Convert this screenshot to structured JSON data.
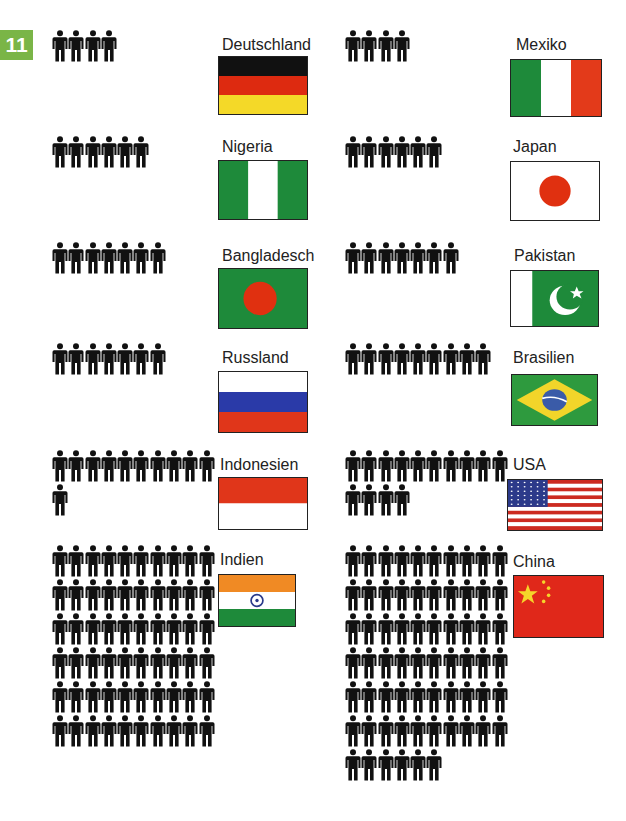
{
  "figure_number": "11",
  "colors": {
    "badge": "#7ab547",
    "figure": "#111111"
  },
  "icon": "person-icon",
  "countries": [
    {
      "name": "Deutschland",
      "figures": 4,
      "flag": "de"
    },
    {
      "name": "Mexiko",
      "figures": 4,
      "flag": "mx"
    },
    {
      "name": "Nigeria",
      "figures": 6,
      "flag": "ng"
    },
    {
      "name": "Japan",
      "figures": 6,
      "flag": "jp"
    },
    {
      "name": "Bangladesch",
      "figures": 7,
      "flag": "bd"
    },
    {
      "name": "Pakistan",
      "figures": 7,
      "flag": "pk"
    },
    {
      "name": "Russland",
      "figures": 7,
      "flag": "ru"
    },
    {
      "name": "Brasilien",
      "figures": 9,
      "flag": "br"
    },
    {
      "name": "Indonesien",
      "figures": 11,
      "flag": "id"
    },
    {
      "name": "USA",
      "figures": 14,
      "flag": "us"
    },
    {
      "name": "Indien",
      "figures": 60,
      "flag": "in"
    },
    {
      "name": "China",
      "figures": 66,
      "flag": "cn"
    }
  ],
  "chart_data": {
    "type": "pictogram",
    "title": "",
    "categories": [
      "Deutschland",
      "Mexiko",
      "Nigeria",
      "Japan",
      "Bangladesch",
      "Pakistan",
      "Russland",
      "Brasilien",
      "Indonesien",
      "USA",
      "Indien",
      "China"
    ],
    "values": [
      4,
      4,
      6,
      6,
      7,
      7,
      7,
      9,
      11,
      14,
      60,
      66
    ],
    "unit": "person icons",
    "xlabel": "",
    "ylabel": "",
    "grid": false,
    "legend": "none"
  }
}
